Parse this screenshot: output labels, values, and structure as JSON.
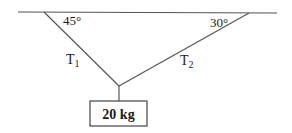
{
  "diagram": {
    "type": "tension-problem",
    "ceiling": {
      "x1": 18,
      "y1": 12,
      "x2": 277,
      "y2": 13
    },
    "ropes": [
      {
        "name": "T1",
        "from": [
          44,
          12
        ],
        "to": [
          119,
          86
        ],
        "angle_with_ceiling": "45°"
      },
      {
        "name": "T2",
        "from": [
          249,
          13
        ],
        "to": [
          119,
          86
        ],
        "angle_with_ceiling": "30°"
      }
    ],
    "hanger": {
      "x": 119,
      "y1": 86,
      "y2": 101
    },
    "mass_box": {
      "x": 90,
      "y": 101,
      "width": 57,
      "height": 25
    },
    "labels": {
      "angle_left": "45°",
      "angle_right": "30°",
      "t1_main": "T",
      "t1_sub": "1",
      "t2_main": "T",
      "t2_sub": "2",
      "mass": "20 kg"
    }
  }
}
